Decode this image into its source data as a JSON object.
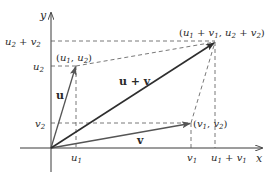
{
  "figure": {
    "colors": {
      "axes": "#3a3a3a",
      "vector": "#555555",
      "sum_vector": "#2e2e2e",
      "dashed": "#555555",
      "text": "#2a2a2a"
    },
    "axes": {
      "x_label": "x",
      "y_label": "y"
    },
    "tick_labels": {
      "x": {
        "u1": "u",
        "u1_sub": "1",
        "v1": "v",
        "v1_sub": "1",
        "sum_a": "u",
        "sum_a_sub": "1",
        "sum_plus": " + ",
        "sum_b": "v",
        "sum_b_sub": "1"
      },
      "y": {
        "sum_a": "u",
        "sum_a_sub": "2",
        "sum_plus": " + ",
        "sum_b": "v",
        "sum_b_sub": "2",
        "u2": "u",
        "u2_sub": "2",
        "v2": "v",
        "v2_sub": "2"
      }
    },
    "vectors": [
      {
        "name": "u",
        "label": "u"
      },
      {
        "name": "v",
        "label": "v"
      },
      {
        "name": "u+v",
        "label": "u + v"
      }
    ],
    "points": {
      "u_tip": {
        "open": "(",
        "a": "u",
        "a_sub": "1",
        "comma": ", ",
        "b": "u",
        "b_sub": "2",
        "close": ")"
      },
      "v_tip": {
        "open": "(",
        "a": "v",
        "a_sub": "1",
        "comma": ", ",
        "b": "v",
        "b_sub": "2",
        "close": ")"
      },
      "sum_tip": {
        "open": "(",
        "a": "u",
        "a_sub": "1",
        "plus1": " + ",
        "b": "v",
        "b_sub": "1",
        "comma": ", ",
        "c": "u",
        "c_sub": "2",
        "plus2": " + ",
        "d": "v",
        "d_sub": "2",
        "close": ")"
      }
    }
  }
}
